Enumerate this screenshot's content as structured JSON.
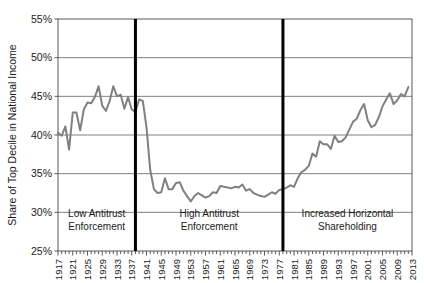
{
  "chart_data": {
    "type": "line",
    "title": "",
    "subtitle": "",
    "xlabel": "",
    "ylabel": "Share of Top Decile in National Income",
    "xlim": [
      1917,
      2013
    ],
    "ylim": [
      25,
      55
    ],
    "ytick_labels": [
      "55%",
      "50%",
      "45%",
      "40%",
      "35%",
      "30%",
      "25%"
    ],
    "ytick_values": [
      55,
      50,
      45,
      40,
      35,
      30,
      25
    ],
    "xtick_labels": [
      "1917",
      "1921",
      "1925",
      "1929",
      "1933",
      "1937",
      "1941",
      "1945",
      "1949",
      "1953",
      "1957",
      "1961",
      "1965",
      "1969",
      "1973",
      "1977",
      "1981",
      "1985",
      "1989",
      "1993",
      "1997",
      "2001",
      "2005",
      "2009",
      "2013"
    ],
    "xtick_values": [
      1917,
      1921,
      1925,
      1929,
      1933,
      1937,
      1941,
      1945,
      1949,
      1953,
      1957,
      1961,
      1965,
      1969,
      1973,
      1977,
      1981,
      1985,
      1989,
      1993,
      1997,
      2001,
      2005,
      2009,
      2013
    ],
    "minor_ticks_every": 1,
    "grid": "horizontal",
    "legend": "none",
    "line_color": "#808080",
    "axis_color": "#595959",
    "grid_color": "#808080",
    "divider_color": "#000000",
    "x": [
      1917,
      1918,
      1919,
      1920,
      1921,
      1922,
      1923,
      1924,
      1925,
      1926,
      1927,
      1928,
      1929,
      1930,
      1931,
      1932,
      1933,
      1934,
      1935,
      1936,
      1937,
      1938,
      1939,
      1940,
      1941,
      1942,
      1943,
      1944,
      1945,
      1946,
      1947,
      1948,
      1949,
      1950,
      1951,
      1952,
      1953,
      1954,
      1955,
      1956,
      1957,
      1958,
      1959,
      1960,
      1961,
      1962,
      1963,
      1964,
      1965,
      1966,
      1967,
      1968,
      1969,
      1970,
      1971,
      1972,
      1973,
      1974,
      1975,
      1976,
      1977,
      1978,
      1979,
      1980,
      1981,
      1982,
      1983,
      1984,
      1985,
      1986,
      1987,
      1988,
      1989,
      1990,
      1991,
      1992,
      1993,
      1994,
      1995,
      1996,
      1997,
      1998,
      1999,
      2000,
      2001,
      2002,
      2003,
      2004,
      2005,
      2006,
      2007,
      2008,
      2009,
      2010,
      2011,
      2012
    ],
    "y": [
      40.3,
      39.9,
      41.1,
      38.1,
      42.9,
      42.9,
      40.6,
      43.3,
      44.2,
      44.1,
      44.9,
      46.3,
      43.8,
      43.1,
      44.4,
      46.3,
      45.0,
      45.2,
      43.4,
      44.9,
      43.3,
      43.0,
      44.6,
      44.4,
      41.0,
      35.5,
      33.0,
      32.5,
      32.6,
      34.4,
      33.0,
      33.0,
      33.8,
      33.9,
      32.8,
      32.1,
      31.4,
      32.1,
      32.5,
      32.2,
      31.9,
      32.1,
      32.6,
      32.5,
      33.4,
      33.3,
      33.2,
      33.1,
      33.3,
      33.2,
      33.6,
      32.8,
      33.0,
      32.5,
      32.3,
      32.1,
      32.0,
      32.3,
      32.6,
      32.4,
      32.9,
      33.0,
      33.2,
      33.5,
      33.3,
      34.4,
      35.2,
      35.5,
      36.0,
      37.6,
      37.2,
      39.2,
      38.8,
      38.8,
      38.2,
      39.9,
      39.1,
      39.2,
      39.7,
      40.7,
      41.7,
      42.1,
      43.2,
      44.0,
      41.9,
      41.0,
      41.3,
      42.3,
      43.7,
      44.6,
      45.4,
      44.0,
      44.5,
      45.3,
      45.0,
      46.2
    ],
    "annotations": [
      {
        "label_line1": "Low Antitrust",
        "label_line2": "Enforcement",
        "x_start": 1917,
        "x_end": 1938
      },
      {
        "label_line1": "High Antitrust",
        "label_line2": "Enforcement",
        "x_start": 1938,
        "x_end": 1978
      },
      {
        "label_line1": "Increased Horizontal",
        "label_line2": "Shareholding",
        "x_start": 1978,
        "x_end": 2013
      }
    ],
    "dividers": [
      1938,
      1978
    ]
  }
}
